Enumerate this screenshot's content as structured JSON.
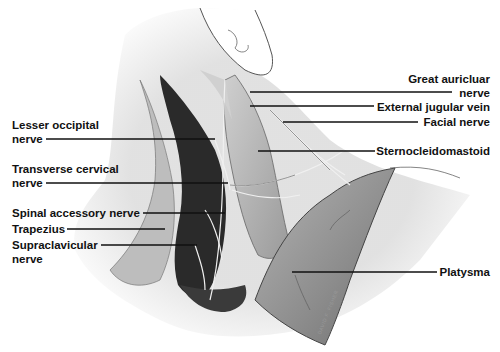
{
  "figure": {
    "signature": "DAVID F. FISHER"
  },
  "labels": {
    "lesser_occipital": [
      "Lesser occipital",
      "nerve"
    ],
    "transverse_cervical": [
      "Transverse cervical",
      "nerve"
    ],
    "spinal_accessory": "Spinal accessory nerve",
    "trapezius": "Trapezius",
    "supraclavicular": [
      "Supraclavicular",
      "nerve"
    ],
    "great_auricular": [
      "Great auricluar",
      "nerve"
    ],
    "external_jugular": "External jugular vein",
    "facial_nerve": "Facial nerve",
    "sternocleidomastoid": "Sternocleidomastoid",
    "platysma": "Platysma"
  },
  "colors": {
    "ink": "#111111",
    "deep_shadow": "#2a2a2a",
    "muscle_mid": "#8e8e8e",
    "muscle_light": "#c9c9c9",
    "skin": "#e4e4e4"
  }
}
